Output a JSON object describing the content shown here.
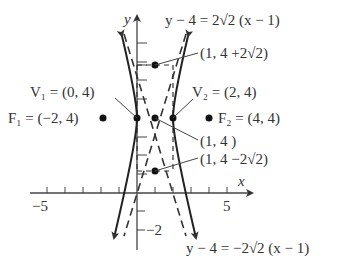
{
  "diagram": {
    "type": "hyperbola-graph",
    "axes": {
      "x_label": "x",
      "y_label": "y",
      "x_tick_labels": [
        {
          "value": -5,
          "text": "−5"
        },
        {
          "value": 5,
          "text": "5"
        }
      ],
      "y_tick_labels": [
        {
          "value": -2,
          "text": "−2"
        }
      ]
    },
    "labels": {
      "asymptote_top": "y − 4 = 2√2 (x − 1)",
      "asymptote_bottom": "y − 4 = −2√2 (x − 1)",
      "v1": "V₁ = (0, 4)",
      "v2": "V₂ = (2, 4)",
      "f1": "F₁ = (−2, 4)",
      "f2": "F₂ = (4, 4)",
      "center": "(1, 4 )",
      "box_top": "(1, 4 +2√2)",
      "box_bottom": "(1, 4 −2√2)"
    },
    "points": [
      {
        "name": "V1",
        "x": 0,
        "y": 4
      },
      {
        "name": "V2",
        "x": 2,
        "y": 4
      },
      {
        "name": "F1",
        "x": -2,
        "y": 4
      },
      {
        "name": "F2",
        "x": 4,
        "y": 4
      },
      {
        "name": "center",
        "x": 1,
        "y": 4
      },
      {
        "name": "box-top",
        "x": 1,
        "y": 6.83
      },
      {
        "name": "box-bottom",
        "x": 1,
        "y": 1.17
      }
    ],
    "colors": {
      "ink": "#333333",
      "background": "#ffffff"
    }
  }
}
